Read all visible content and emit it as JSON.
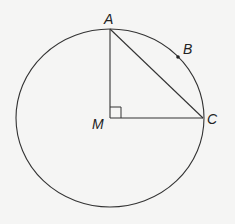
{
  "diagram": {
    "title": "",
    "points": {
      "A": {
        "label": "A",
        "x": 110,
        "y": 29
      },
      "B": {
        "label": "B",
        "x": 178,
        "y": 57
      },
      "C": {
        "label": "C",
        "x": 203,
        "y": 118
      },
      "M": {
        "label": "M",
        "x": 110,
        "y": 118
      }
    },
    "circle": {
      "center": "M",
      "cx": 110,
      "cy": 118,
      "rx": 94,
      "ry": 89
    },
    "segments": [
      [
        "M",
        "A"
      ],
      [
        "M",
        "C"
      ],
      [
        "A",
        "C"
      ]
    ],
    "right_angle_at": "M",
    "colors": {
      "stroke": "#333333",
      "background": "#f5f5f4"
    }
  }
}
